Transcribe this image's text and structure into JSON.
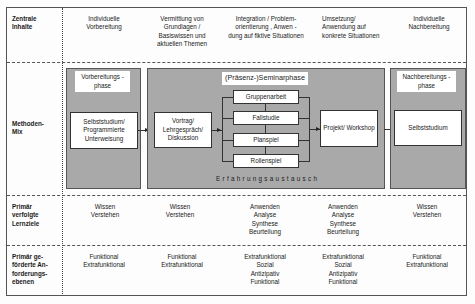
{
  "rows": {
    "inhalte": {
      "label": "Zentrale Inhalte",
      "cells": [
        "Individuelle Vorbereitung",
        "Vermittlung von Grundlagen / Basiswissen und aktuellen Themen",
        "Integration / Problem-orientierung , Anwen - dung auf fiktive Situationen",
        "Umsetzung/ Anwendung auf konkrete Situationen",
        "Individuelle Nachbereitung"
      ]
    },
    "methoden": {
      "label": "Methoden-Mix",
      "vorbereitung": {
        "title": "Vorbereitungs - phase",
        "box": "Selbststudium/ Programmierte Unterweisung"
      },
      "seminar": {
        "title": "(Präsenz-)Seminarphase",
        "vortrag": "Vortrag/ Lehrgespräch/ Diskussion",
        "methods": [
          "Gruppenarbeit",
          "Fallstudie",
          "Planspiel",
          "Rollenspiel"
        ],
        "projekt": "Projekt/ Workshop",
        "footer": "Erfahrungsaustausch"
      },
      "nachbereitung": {
        "title": "Nachbereitungs - phase",
        "box": "Selbststudium"
      }
    },
    "lernziele": {
      "label": "Primär verfolgte Lernziele",
      "cells": [
        [
          "Wissen",
          "Verstehen"
        ],
        [
          "Wissen",
          "Verstehen"
        ],
        [
          "Anwenden",
          "Analyse",
          "Synthese",
          "Beurteilung"
        ],
        [
          "Anwenden",
          "Analyse",
          "Synthese",
          "Beurteilung"
        ],
        [
          "Wissen",
          "Verstehen"
        ]
      ]
    },
    "anforderungen": {
      "label": "Primär ge-förderte An-forderungs-ebenen",
      "cells": [
        [
          "Funktional",
          "Extrafunktional"
        ],
        [
          "Funktional",
          "Extrafunktional"
        ],
        [
          "Extrafunktional",
          "Sozial",
          "Antizipativ",
          "Funktional"
        ],
        [
          "Extrafunktional",
          "Sozial",
          "Antizipativ",
          "Funktional"
        ],
        [
          "Funktional",
          "Extrafunktional"
        ]
      ]
    }
  }
}
